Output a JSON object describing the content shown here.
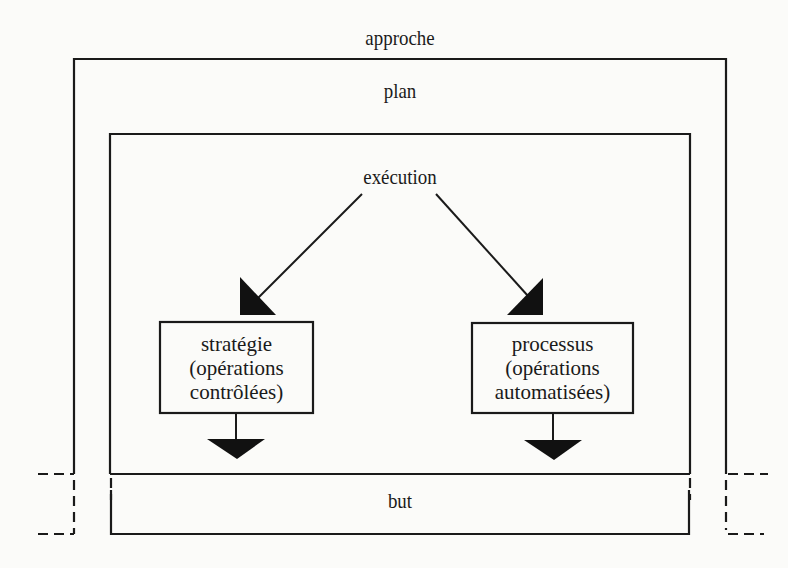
{
  "diagram": {
    "labels": {
      "approach": "approche",
      "plan": "plan",
      "execution": "exécution",
      "goal": "but"
    },
    "boxes": {
      "strategy": {
        "lines": [
          "stratégie",
          "(opérations",
          "contrôlées)"
        ]
      },
      "process": {
        "lines": [
          "processus",
          "(opérations",
          "automatisées)"
        ]
      }
    },
    "edges": [
      {
        "from": "exécution",
        "to": "stratégie (opérations contrôlées)"
      },
      {
        "from": "exécution",
        "to": "processus (opérations automatisées)"
      },
      {
        "from": "stratégie (opérations contrôlées)",
        "to": "but"
      },
      {
        "from": "processus (opérations automatisées)",
        "to": "but"
      }
    ],
    "nesting": [
      "approche",
      "plan",
      "exécution"
    ],
    "colors": {
      "line": "#1a1a1a",
      "background": "#fbfbf9"
    }
  }
}
